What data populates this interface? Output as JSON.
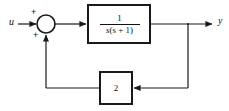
{
  "diagram": {
    "type": "control-system-block-diagram",
    "line_color": "#1a1a1a",
    "background_color": "#ffffff",
    "signals": {
      "input_label": "u",
      "output_label": "y"
    },
    "summing_junction": {
      "name": "summing-junction",
      "sign_top": "+",
      "sign_bottom": "+",
      "center_x": 46,
      "center_y": 24,
      "radius": 9
    },
    "plant_block": {
      "name": "transfer-function-block",
      "numerator": "1",
      "denominator_var": "s",
      "denominator_factor": "(s + 1)",
      "expression": "1 / (s(s + 1))"
    },
    "feedback_block": {
      "name": "feedback-gain-block",
      "gain": "2"
    }
  }
}
